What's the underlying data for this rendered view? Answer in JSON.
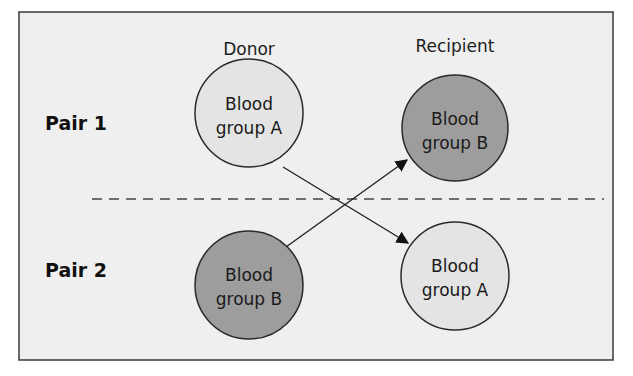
{
  "diagram": {
    "columns": {
      "donor": "Donor",
      "recipient": "Recipient"
    },
    "pairs": [
      {
        "label": "Pair 1",
        "donor": {
          "line1": "Blood",
          "line2": "group A",
          "shade": "light"
        },
        "recipient": {
          "line1": "Blood",
          "line2": "group B",
          "shade": "dark"
        }
      },
      {
        "label": "Pair 2",
        "donor": {
          "line1": "Blood",
          "line2": "group B",
          "shade": "dark"
        },
        "recipient": {
          "line1": "Blood",
          "line2": "group A",
          "shade": "light"
        }
      }
    ],
    "arrows": [
      {
        "from": "Pair 1 donor (Blood group A)",
        "to": "Pair 2 recipient (Blood group A)"
      },
      {
        "from": "Pair 2 donor (Blood group B)",
        "to": "Pair 1 recipient (Blood group B)"
      }
    ],
    "colors": {
      "background": "#efefef",
      "light_circle": "#e4e4e4",
      "dark_circle": "#9d9d9d",
      "stroke": "#2a2a2a"
    }
  }
}
